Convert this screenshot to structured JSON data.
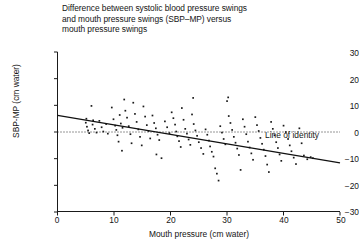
{
  "chart_data": {
    "type": "scatter",
    "title": "Difference between systolic blood pressure swings\nand mouth pressure swings (SBP–MP) versus\nmouth pressure swings",
    "xlabel": "Mouth pressure (cm water)",
    "ylabel": "SBP-MP (cm water)",
    "xlim": [
      0,
      50
    ],
    "ylim": [
      -30,
      30
    ],
    "xticks": [
      0,
      10,
      20,
      30,
      40,
      50
    ],
    "yticks": [
      30,
      20,
      10,
      0,
      -10,
      -20,
      -30
    ],
    "ytick_labels": [
      "30",
      "20",
      "10",
      "0",
      "−10",
      "−20",
      "−30"
    ],
    "grid": false,
    "legend": null,
    "annotations": [
      {
        "text": "Line of identity",
        "x": 37,
        "y": 1.5,
        "refers_to": "zero-reference-line"
      }
    ],
    "reference_lines": [
      {
        "name": "line-of-identity",
        "style": "dotted",
        "y": 0,
        "from_x": 0,
        "to_x": 50
      }
    ],
    "fit_line": {
      "name": "regression-line",
      "style": "solid",
      "points": [
        [
          0,
          6.2
        ],
        [
          50,
          -11.6
        ]
      ],
      "slope": -0.356,
      "intercept": 6.2
    },
    "points": [
      [
        5.0,
        3.5
      ],
      [
        5.2,
        2.0
      ],
      [
        5.4,
        0.6
      ],
      [
        5.6,
        -0.4
      ],
      [
        5.1,
        5.0
      ],
      [
        6.0,
        9.8
      ],
      [
        6.3,
        4.4
      ],
      [
        6.6,
        1.2
      ],
      [
        6.9,
        -0.2
      ],
      [
        6.2,
        2.8
      ],
      [
        7.4,
        4.2
      ],
      [
        7.8,
        1.8
      ],
      [
        8.1,
        0.2
      ],
      [
        8.6,
        3.0
      ],
      [
        8.9,
        -0.6
      ],
      [
        9.6,
        9.2
      ],
      [
        9.9,
        4.8
      ],
      [
        10.2,
        2.4
      ],
      [
        10.4,
        0.8
      ],
      [
        10.6,
        -1.2
      ],
      [
        10.8,
        -3.6
      ],
      [
        11.0,
        6.4
      ],
      [
        11.2,
        3.2
      ],
      [
        11.5,
        1.6
      ],
      [
        11.8,
        12.2
      ],
      [
        12.0,
        8.0
      ],
      [
        12.3,
        5.4
      ],
      [
        12.6,
        2.2
      ],
      [
        12.9,
        -0.8
      ],
      [
        13.1,
        -4.2
      ],
      [
        13.4,
        11.0
      ],
      [
        13.7,
        6.8
      ],
      [
        14.0,
        3.8
      ],
      [
        14.3,
        1.0
      ],
      [
        14.6,
        -1.8
      ],
      [
        14.9,
        -5.0
      ],
      [
        15.2,
        9.6
      ],
      [
        15.5,
        5.8
      ],
      [
        15.8,
        2.6
      ],
      [
        16.1,
        0.4
      ],
      [
        16.4,
        -2.4
      ],
      [
        16.8,
        6.2
      ],
      [
        17.1,
        3.4
      ],
      [
        17.4,
        1.4
      ],
      [
        17.7,
        -1.0
      ],
      [
        18.0,
        -3.0
      ],
      [
        18.4,
        -9.8
      ],
      [
        19.0,
        4.0
      ],
      [
        19.4,
        1.8
      ],
      [
        19.8,
        -0.4
      ],
      [
        20.2,
        7.4
      ],
      [
        20.5,
        5.2
      ],
      [
        20.8,
        2.8
      ],
      [
        21.0,
        0.2
      ],
      [
        21.2,
        -1.6
      ],
      [
        21.5,
        -3.4
      ],
      [
        21.8,
        -5.6
      ],
      [
        22.0,
        9.0
      ],
      [
        22.3,
        4.6
      ],
      [
        22.6,
        1.2
      ],
      [
        22.9,
        -0.6
      ],
      [
        23.2,
        -2.8
      ],
      [
        23.5,
        -4.8
      ],
      [
        23.8,
        6.6
      ],
      [
        24.1,
        3.0
      ],
      [
        24.4,
        0.6
      ],
      [
        24.7,
        -1.4
      ],
      [
        25.0,
        -3.8
      ],
      [
        25.4,
        -6.0
      ],
      [
        25.8,
        -8.2
      ],
      [
        26.2,
        1.0
      ],
      [
        26.5,
        -1.0
      ],
      [
        26.8,
        -3.2
      ],
      [
        27.0,
        -5.4
      ],
      [
        27.3,
        -7.4
      ],
      [
        27.6,
        -9.2
      ],
      [
        27.9,
        -13.6
      ],
      [
        28.2,
        -15.6
      ],
      [
        28.5,
        -18.2
      ],
      [
        28.8,
        2.2
      ],
      [
        29.1,
        -0.2
      ],
      [
        29.4,
        -2.6
      ],
      [
        29.7,
        -4.6
      ],
      [
        30.0,
        11.6
      ],
      [
        30.3,
        6.0
      ],
      [
        30.6,
        3.4
      ],
      [
        30.9,
        0.8
      ],
      [
        31.2,
        -1.8
      ],
      [
        31.5,
        -4.0
      ],
      [
        31.8,
        -6.2
      ],
      [
        32.1,
        -8.6
      ],
      [
        32.4,
        -14.2
      ],
      [
        32.8,
        4.8
      ],
      [
        33.1,
        2.0
      ],
      [
        33.4,
        -0.8
      ],
      [
        33.7,
        -3.6
      ],
      [
        34.0,
        -5.8
      ],
      [
        34.3,
        -8.0
      ],
      [
        34.6,
        -10.4
      ],
      [
        35.0,
        5.6
      ],
      [
        35.3,
        2.6
      ],
      [
        35.6,
        0.4
      ],
      [
        35.9,
        -2.2
      ],
      [
        36.2,
        -4.4
      ],
      [
        36.5,
        -6.6
      ],
      [
        36.8,
        -9.0
      ],
      [
        37.1,
        -12.2
      ],
      [
        37.4,
        -15.0
      ],
      [
        37.8,
        3.8
      ],
      [
        38.1,
        1.2
      ],
      [
        38.4,
        -1.2
      ],
      [
        38.7,
        -3.8
      ],
      [
        39.0,
        -6.0
      ],
      [
        39.3,
        -8.4
      ],
      [
        39.6,
        -10.8
      ],
      [
        40.0,
        2.4
      ],
      [
        40.4,
        0.0
      ],
      [
        40.8,
        -2.6
      ],
      [
        41.1,
        -5.0
      ],
      [
        41.4,
        -7.2
      ],
      [
        41.8,
        -9.6
      ],
      [
        42.2,
        -12.0
      ],
      [
        42.8,
        1.4
      ],
      [
        43.2,
        -4.2
      ],
      [
        43.6,
        -8.8
      ],
      [
        44.2,
        -10.2
      ],
      [
        44.8,
        -9.4
      ],
      [
        45.2,
        -9.8
      ],
      [
        17.5,
        -8.4
      ],
      [
        11.4,
        -7.0
      ],
      [
        24.0,
        12.8
      ],
      [
        30.2,
        13.0
      ]
    ]
  }
}
